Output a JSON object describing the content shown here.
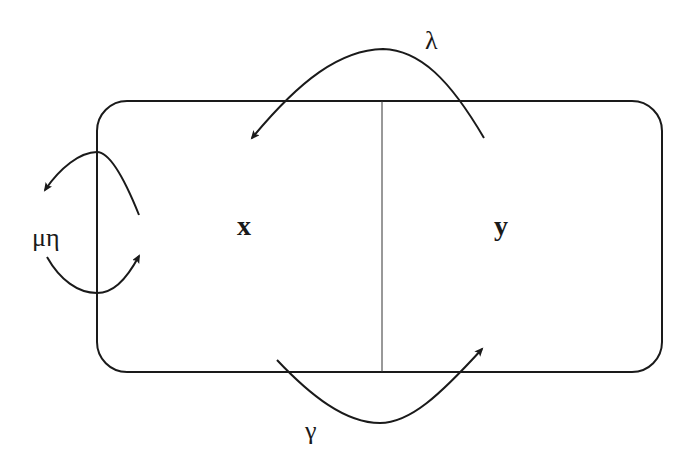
{
  "diagram": {
    "type": "compartment-flow",
    "compartments": [
      {
        "id": "x",
        "label": "x"
      },
      {
        "id": "y",
        "label": "y"
      }
    ],
    "flows": [
      {
        "id": "lambda",
        "label": "λ",
        "from": "y",
        "to": "x",
        "position": "top"
      },
      {
        "id": "gamma",
        "label": "γ",
        "from": "x",
        "to": "y",
        "position": "bottom"
      },
      {
        "id": "mu_eta",
        "label": "μη",
        "from": "x",
        "to": "outside/inside",
        "position": "left"
      }
    ],
    "colors": {
      "stroke": "#1a1a1a",
      "background": "#ffffff"
    }
  }
}
